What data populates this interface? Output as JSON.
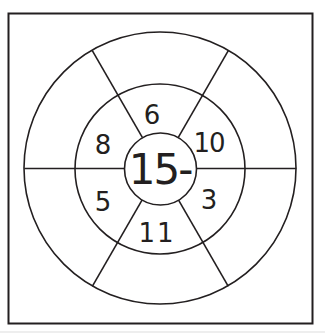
{
  "diagram": {
    "type": "subtraction-wheel",
    "center_label": "15-",
    "segments": [
      {
        "position": "top",
        "value": "6"
      },
      {
        "position": "upper-right",
        "value": "10"
      },
      {
        "position": "lower-right",
        "value": "3"
      },
      {
        "position": "bottom",
        "value": "11"
      },
      {
        "position": "lower-left",
        "value": "5"
      },
      {
        "position": "upper-left",
        "value": "8"
      }
    ],
    "outer_answers": [
      "",
      "",
      "",
      "",
      "",
      ""
    ],
    "colors": {
      "stroke": "#231f20",
      "background": "#ffffff"
    }
  }
}
